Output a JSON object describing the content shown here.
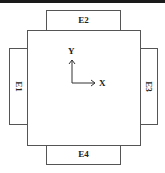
{
  "diagram": {
    "panels": {
      "top": "E2",
      "left": "E1",
      "right": "E3",
      "bottom": "E4"
    },
    "axes": {
      "x_label": "X",
      "y_label": "Y"
    },
    "colors": {
      "stroke": "#555555",
      "text": "#222222",
      "top_bar": "#1a1a1a"
    }
  }
}
